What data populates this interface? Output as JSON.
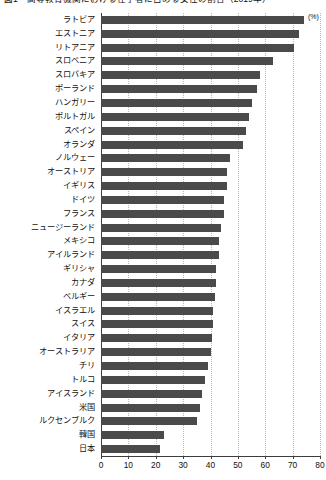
{
  "chart_data": {
    "type": "bar",
    "orientation": "horizontal",
    "title": "図1　高等教育機関における在学者に占める女性の割合（2019年）",
    "xlabel": "",
    "ylabel": "",
    "xunit": "(%)",
    "xlim": [
      0,
      80
    ],
    "xticks": [
      0,
      10,
      20,
      30,
      40,
      50,
      60,
      70,
      80
    ],
    "xtick_labels": [
      "0",
      "10",
      "20",
      "30",
      "40",
      "50",
      "60",
      "70",
      "80"
    ],
    "grid": "vertical-dotted",
    "legend": "none",
    "bar_color": "#4a4a4a",
    "categories": [
      "ラトビア",
      "エストニア",
      "リトアニア",
      "スロベニア",
      "スロバキア",
      "ポーランド",
      "ハンガリー",
      "ポルトガル",
      "スペイン",
      "オランダ",
      "ノルウェー",
      "オーストリア",
      "イギリス",
      "ドイツ",
      "フランス",
      "ニュージーランド",
      "メキシコ",
      "アイルランド",
      "ギリシャ",
      "カナダ",
      "ベルギー",
      "イスラエル",
      "スイス",
      "イタリア",
      "オーストラリア",
      "チリ",
      "トルコ",
      "アイスランド",
      "米国",
      "ルクセンブルク",
      "韓国",
      "日本"
    ],
    "values": [
      74.0,
      72.5,
      70.5,
      63.0,
      58.0,
      57.0,
      55.0,
      54.0,
      53.0,
      52.0,
      47.0,
      46.0,
      46.0,
      45.0,
      45.0,
      44.0,
      43.0,
      43.0,
      42.0,
      42.0,
      41.5,
      41.0,
      41.0,
      40.5,
      40.0,
      39.0,
      38.0,
      37.0,
      36.0,
      35.0,
      23.0,
      21.5
    ]
  }
}
